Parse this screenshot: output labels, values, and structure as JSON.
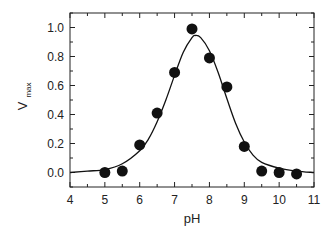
{
  "chart_data": {
    "type": "scatter",
    "title": "",
    "xlabel": "pH",
    "ylabel": "V",
    "ylabel_subscript": "max",
    "xlim": [
      4,
      11
    ],
    "ylim": [
      -0.1,
      1.1
    ],
    "grid": false,
    "legend": null,
    "xticks": [
      4,
      5,
      6,
      7,
      8,
      9,
      10,
      11
    ],
    "xtick_labels": [
      "4",
      "5",
      "6",
      "7",
      "8",
      "9",
      "10",
      "11"
    ],
    "xminor_step": 0.5,
    "yticks": [
      0.0,
      0.2,
      0.4,
      0.6,
      0.8,
      1.0
    ],
    "ytick_labels": [
      "0.0",
      "0.2",
      "0.4",
      "0.6",
      "0.8",
      "1.0"
    ],
    "yminor_step": 0.1,
    "series": [
      {
        "name": "measured",
        "kind": "points",
        "color": "#111111",
        "x": [
          5.0,
          5.5,
          6.0,
          6.5,
          7.0,
          7.5,
          8.0,
          8.5,
          9.0,
          9.5,
          10.0,
          10.5
        ],
        "y": [
          0.0,
          0.01,
          0.19,
          0.41,
          0.69,
          0.99,
          0.79,
          0.59,
          0.18,
          0.01,
          0.0,
          -0.01
        ]
      },
      {
        "name": "fit",
        "kind": "line",
        "color": "#111111",
        "x": [
          4.0,
          4.5,
          5.0,
          5.5,
          6.0,
          6.25,
          6.5,
          6.75,
          7.0,
          7.25,
          7.5,
          7.6,
          7.75,
          8.0,
          8.25,
          8.5,
          8.75,
          9.0,
          9.25,
          9.5,
          10.0,
          10.5,
          11.0
        ],
        "y": [
          0.0,
          0.01,
          0.02,
          0.06,
          0.15,
          0.23,
          0.35,
          0.5,
          0.67,
          0.83,
          0.93,
          0.945,
          0.93,
          0.84,
          0.69,
          0.51,
          0.34,
          0.21,
          0.12,
          0.07,
          0.03,
          0.01,
          0.0
        ]
      }
    ]
  }
}
